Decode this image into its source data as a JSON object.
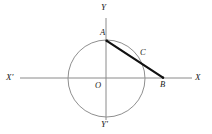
{
  "figure": {
    "background_color": "#ffffff",
    "width": 212,
    "height": 134,
    "axis_color": "#8a8a8a",
    "circle_color": "#8f8f8f",
    "chord_color": "#111111"
  },
  "axes": {
    "x_axis": {
      "negative_label": "X'",
      "positive_label": "X",
      "y_position": 78,
      "x_start": 20,
      "x_end": 192
    },
    "y_axis": {
      "positive_label": "Y",
      "negative_label": "Y'",
      "x_position": 106,
      "y_start": 18,
      "y_end": 120
    },
    "origin_label": "O"
  },
  "circle": {
    "center_x": 106.5,
    "center_y": 78.5,
    "radius": 38.5
  },
  "points": {
    "A": {
      "label": "A",
      "x": 106.5,
      "y": 40.5,
      "description": "top of circle on Y axis"
    },
    "B": {
      "label": "B",
      "x": 163,
      "y": 78,
      "description": "on X axis outside circle"
    },
    "C": {
      "label": "C",
      "x": 139,
      "y": 56.5,
      "description": "second intersection of chord AB with circle"
    },
    "O": {
      "label": "O",
      "x": 106.5,
      "y": 78.5,
      "description": "origin / circle center"
    }
  },
  "segments": {
    "AB": {
      "from": "A",
      "to": "B",
      "style": "thick",
      "label": ""
    }
  }
}
